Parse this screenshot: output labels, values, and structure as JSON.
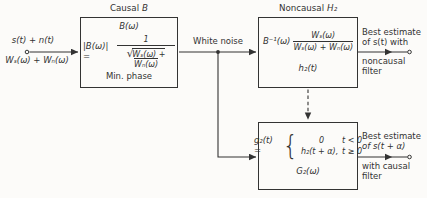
{
  "colors": {
    "ink": "#333333",
    "bg": "#fcfbf9"
  },
  "input": {
    "signal": "s(t) + n(t)",
    "spectrum": "Wₛ(ω) + Wₙ(ω)"
  },
  "wire": {
    "label": "White noise"
  },
  "box1": {
    "title_prefix": "Causal",
    "title_var": "B",
    "transfer": "B(ω)",
    "eq_lhs": "|B(ω)| =",
    "eq_num": "1",
    "eq_root_sign": "√",
    "eq_radicand": "Wₛ(ω) + Wₙ(ω)",
    "note": "Min. phase"
  },
  "box2": {
    "title_prefix": "Noncausal",
    "title_var": "H₂",
    "eq_prefix": "B⁻¹(ω)",
    "frac_num": "Wₛ(ω)",
    "frac_den": "Wₛ(ω) + Wₙ(ω)",
    "impulse": "h₂(t)"
  },
  "box3": {
    "eq_lhs": "g₂(t) =",
    "brace": "{",
    "case1_val": "0",
    "case1_cond": "t < 0",
    "case2_val": "h₂(t + α),",
    "case2_cond": "t ≥ 0",
    "transfer": "G₂(ω)"
  },
  "output_top": {
    "line1": "Best estimate",
    "line2": "of s(t) with",
    "line3": "noncausal",
    "line4": "filter"
  },
  "output_bottom": {
    "line1": "Best estimate",
    "line2": "of s(t + α)",
    "line3": "with causal",
    "line4": "filter"
  }
}
